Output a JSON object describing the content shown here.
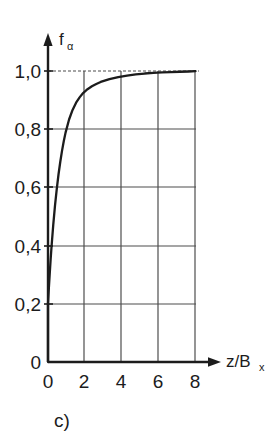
{
  "figure": {
    "caption": "c)",
    "background_color": "#ffffff",
    "ink_color": "#1c1c1c",
    "grid_color": "#4d4d4d"
  },
  "axes": {
    "y_title_base": "f",
    "y_title_sub": "α",
    "x_title_base": "z/B",
    "x_title_sub": "x",
    "origin_label": "0"
  },
  "chart_data": {
    "type": "line",
    "title": "",
    "subtitle": "",
    "xlabel": "z/Bx",
    "ylabel": "f_alpha",
    "xlim": [
      0,
      8.6
    ],
    "ylim": [
      0,
      1.05
    ],
    "grid": true,
    "legend": null,
    "xticks": [
      0,
      2,
      4,
      6,
      8
    ],
    "xtick_labels": [
      "0",
      "2",
      "4",
      "6",
      "8"
    ],
    "yticks": [
      0.2,
      0.4,
      0.6,
      0.8,
      1.0
    ],
    "ytick_labels": [
      "0,2",
      "0,4",
      "0,6",
      "0,8",
      "1,0"
    ],
    "series": [
      {
        "name": "f_alpha",
        "x": [
          0,
          0.05,
          0.1,
          0.15,
          0.2,
          0.3,
          0.4,
          0.5,
          0.6,
          0.7,
          0.8,
          0.9,
          1.0,
          1.2,
          1.4,
          1.6,
          1.8,
          2.0,
          2.25,
          2.5,
          2.75,
          3.0,
          3.5,
          4.0,
          4.5,
          5.0,
          5.5,
          6.0,
          6.5,
          7.0,
          7.5,
          8.0,
          8.4
        ],
        "y": [
          0.2,
          0.255,
          0.305,
          0.352,
          0.395,
          0.472,
          0.538,
          0.595,
          0.645,
          0.688,
          0.726,
          0.759,
          0.788,
          0.833,
          0.866,
          0.891,
          0.909,
          0.924,
          0.937,
          0.947,
          0.955,
          0.962,
          0.972,
          0.979,
          0.984,
          0.988,
          0.991,
          0.993,
          0.995,
          0.996,
          0.997,
          0.998,
          0.999
        ]
      }
    ],
    "annotations": [
      {
        "text": "c)",
        "role": "figure-caption"
      }
    ]
  }
}
